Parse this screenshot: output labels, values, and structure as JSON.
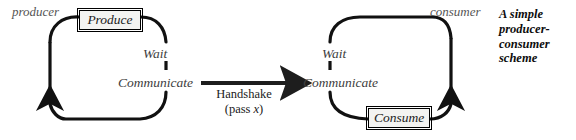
{
  "figure": {
    "caption": {
      "lines": [
        "A simple",
        "producer-",
        "consumer",
        "scheme"
      ]
    },
    "producer_cycle": {
      "actor_label": "producer",
      "box_label": "Produce",
      "state_wait": "Wait",
      "state_communicate": "Communicate"
    },
    "consumer_cycle": {
      "actor_label": "consumer",
      "box_label": "Consume",
      "state_wait": "Wait",
      "state_communicate": "Communicate"
    },
    "handshake": {
      "line1": "Handshake",
      "line2_prefix": "(pass ",
      "line2_var": "x",
      "line2_suffix": ")"
    },
    "colors": {
      "stroke": "#111111",
      "actor_text": "#555555",
      "state_text": "#3d3d3d",
      "box_fill": "#f3f3f1",
      "background": "#ffffff"
    }
  }
}
